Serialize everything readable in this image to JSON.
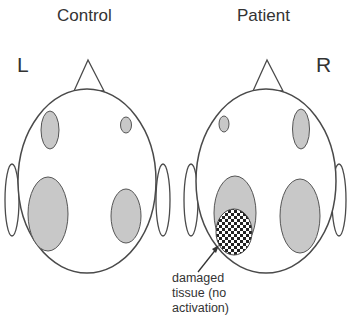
{
  "panels": {
    "control": {
      "title": "Control"
    },
    "patient": {
      "title": "Patient"
    }
  },
  "side_labels": {
    "left": "L",
    "right": "R"
  },
  "annotation": {
    "line1": "damaged",
    "line2": "tissue (no",
    "line3": "activation)"
  },
  "colors": {
    "outline": "#4a4a4a",
    "activation_fill": "#c8c8c8",
    "background": "#ffffff",
    "damage_dark": "#222222"
  }
}
